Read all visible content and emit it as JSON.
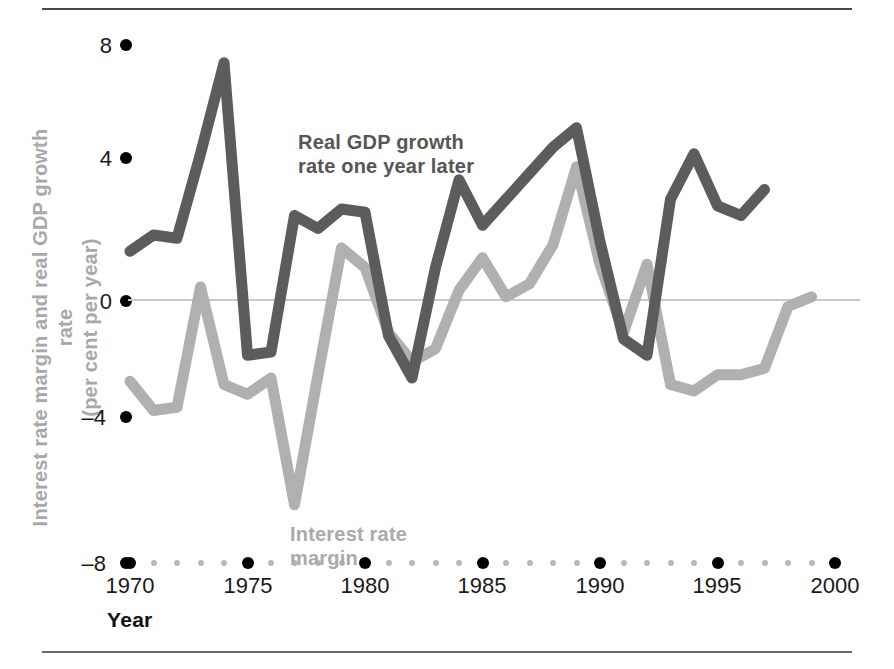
{
  "chart_data": {
    "type": "line",
    "title": "",
    "xlabel": "Year",
    "ylabel": "Interest rate margin and real GDP growth rate\n(per cent per year)",
    "ylabel_line1": "Interest rate margin and real GDP growth rate",
    "ylabel_line2": "(per cent per year)",
    "xlim": [
      1970,
      2000
    ],
    "ylim": [
      -8,
      8
    ],
    "yticks": [
      8,
      4,
      0,
      -4,
      -8
    ],
    "ytick_labels": [
      "8",
      "4",
      "0",
      "–4",
      "–8"
    ],
    "xticks": [
      1970,
      1975,
      1980,
      1985,
      1990,
      1995,
      2000
    ],
    "xtick_labels": [
      "1970",
      "1975",
      "1980",
      "1985",
      "1990",
      "1995",
      "2000"
    ],
    "x_minor_ticks": [
      1971,
      1972,
      1973,
      1974,
      1976,
      1977,
      1978,
      1979,
      1981,
      1982,
      1983,
      1984,
      1986,
      1987,
      1988,
      1989,
      1991,
      1992,
      1993,
      1994,
      1996,
      1997,
      1998,
      1999
    ],
    "grid": false,
    "zero_line": true,
    "legend_position": "inline-annotations",
    "x": [
      1970,
      1971,
      1972,
      1973,
      1974,
      1975,
      1976,
      1977,
      1978,
      1979,
      1980,
      1981,
      1982,
      1983,
      1984,
      1985,
      1986,
      1987,
      1988,
      1989,
      1990,
      1991,
      1992,
      1993,
      1994,
      1995,
      1996,
      1997,
      1998,
      1999
    ],
    "series": [
      {
        "name": "Real GDP growth rate one year later",
        "color": "#5c5c5c",
        "values": [
          1.5,
          2.0,
          1.9,
          4.5,
          7.3,
          -1.7,
          -1.6,
          2.6,
          2.2,
          2.8,
          2.7,
          -1.1,
          -2.4,
          1.0,
          3.7,
          2.3,
          3.1,
          3.9,
          4.7,
          5.3,
          1.8,
          -1.2,
          -1.7,
          3.1,
          4.5,
          2.9,
          2.6,
          3.4,
          0,
          0
        ]
      },
      {
        "name": "Interest rate margin",
        "color": "#b0b0b0",
        "values": [
          -2.5,
          -3.4,
          -3.3,
          0.4,
          -2.6,
          -2.9,
          -2.4,
          -6.3,
          -2.3,
          1.6,
          1.0,
          -1.0,
          -1.9,
          -1.5,
          0.3,
          1.3,
          0.1,
          0.5,
          1.7,
          4.1,
          1.1,
          -1.0,
          1.1,
          -2.6,
          -2.8,
          -2.3,
          -2.3,
          -2.1,
          -0.2,
          0.1
        ]
      }
    ],
    "annotations": [
      {
        "text_line1": "Real GDP growth",
        "text_line2": "rate one year later",
        "color": "#565656",
        "x": 1977,
        "y": 5.2
      },
      {
        "text_line1": "Interest rate",
        "text_line2": "margin",
        "color": "#aaaaaa",
        "x": 1977,
        "y": -6.7
      }
    ]
  },
  "axes": {
    "x_axis_title": "Year",
    "y_axis_title_line1": "Interest rate margin and real GDP growth rate",
    "y_axis_title_line2": "(per cent per year)"
  },
  "colors": {
    "gdp_line": "#5c5c5c",
    "margin_line": "#b0b0b0",
    "tick_dot_major": "#000000",
    "tick_dot_minor": "#b9b9b9",
    "zero_line": "#c9c9c9",
    "rule": "#4a4a4a",
    "background": "#ffffff"
  }
}
